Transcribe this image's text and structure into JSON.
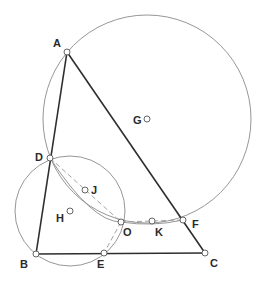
{
  "colors": {
    "background": "#ffffff",
    "thick_line": "#2e2e2e",
    "thin_line": "#8a8a8a",
    "dashed_line": "#9a9a9a",
    "point_stroke": "#555555",
    "label": "#2a2a2a"
  },
  "points": {
    "A": {
      "label": "A",
      "x": 67,
      "y": 52
    },
    "B": {
      "label": "B",
      "x": 36,
      "y": 254
    },
    "C": {
      "label": "C",
      "x": 205,
      "y": 253
    },
    "D": {
      "label": "D",
      "x": 50,
      "y": 158
    },
    "E": {
      "label": "E",
      "x": 104,
      "y": 253
    },
    "F": {
      "label": "F",
      "x": 183,
      "y": 220
    },
    "G": {
      "label": "G",
      "x": 147,
      "y": 119
    },
    "H": {
      "label": "H",
      "x": 70,
      "y": 211
    },
    "J": {
      "label": "J",
      "x": 85,
      "y": 190
    },
    "K": {
      "label": "K",
      "x": 152,
      "y": 221
    },
    "O": {
      "label": "O",
      "x": 121,
      "y": 222
    }
  },
  "labels": {
    "A": "A",
    "B": "B",
    "C": "C",
    "D": "D",
    "E": "E",
    "F": "F",
    "G": "G",
    "H": "H",
    "J": "J",
    "K": "K",
    "O": "O"
  },
  "segments_solid": [
    "A-B",
    "A-C",
    "B-C"
  ],
  "segments_dashed": [
    "D-O",
    "O-F",
    "O-E"
  ],
  "circles": [
    {
      "name": "circle-G",
      "center": "G",
      "radius": 104
    },
    {
      "name": "circle-H",
      "center": "H",
      "radius": 55
    }
  ],
  "arcs": [
    {
      "name": "arc-D-O-F",
      "through": [
        "D",
        "O",
        "F"
      ]
    }
  ]
}
